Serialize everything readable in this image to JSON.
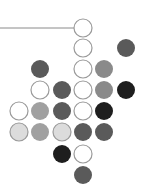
{
  "diagram": {
    "background": "#ffffff",
    "connector_line": {
      "x1": 0,
      "y1": 28,
      "x2": 74,
      "y2": 28,
      "color": "#8a8a8a"
    },
    "grid": {
      "col_x": [
        19,
        40,
        62,
        83,
        104,
        126
      ],
      "row_y": [
        28,
        48,
        69,
        90,
        111,
        132,
        154,
        175
      ],
      "radius": 9
    },
    "palette": {
      "open": "#ffffff",
      "very_light": "#dcdcdc",
      "light": "#a0a0a0",
      "medium": "#8a8a8a",
      "dark": "#5a5a5a",
      "black": "#1e1e1e",
      "outline": "#9a9a9a"
    },
    "circles": [
      {
        "row": 0,
        "col": 3,
        "fill": "open"
      },
      {
        "row": 1,
        "col": 3,
        "fill": "open"
      },
      {
        "row": 1,
        "col": 5,
        "fill": "dark"
      },
      {
        "row": 2,
        "col": 1,
        "fill": "dark"
      },
      {
        "row": 2,
        "col": 3,
        "fill": "open"
      },
      {
        "row": 2,
        "col": 4,
        "fill": "medium"
      },
      {
        "row": 3,
        "col": 1,
        "fill": "open"
      },
      {
        "row": 3,
        "col": 2,
        "fill": "dark"
      },
      {
        "row": 3,
        "col": 3,
        "fill": "open"
      },
      {
        "row": 3,
        "col": 4,
        "fill": "medium"
      },
      {
        "row": 3,
        "col": 5,
        "fill": "black"
      },
      {
        "row": 4,
        "col": 0,
        "fill": "open"
      },
      {
        "row": 4,
        "col": 1,
        "fill": "light"
      },
      {
        "row": 4,
        "col": 2,
        "fill": "dark"
      },
      {
        "row": 4,
        "col": 3,
        "fill": "open"
      },
      {
        "row": 4,
        "col": 4,
        "fill": "black"
      },
      {
        "row": 5,
        "col": 0,
        "fill": "very_light"
      },
      {
        "row": 5,
        "col": 1,
        "fill": "light"
      },
      {
        "row": 5,
        "col": 2,
        "fill": "very_light"
      },
      {
        "row": 5,
        "col": 3,
        "fill": "dark"
      },
      {
        "row": 5,
        "col": 4,
        "fill": "dark"
      },
      {
        "row": 6,
        "col": 2,
        "fill": "black"
      },
      {
        "row": 6,
        "col": 3,
        "fill": "open"
      },
      {
        "row": 7,
        "col": 3,
        "fill": "dark"
      }
    ]
  }
}
